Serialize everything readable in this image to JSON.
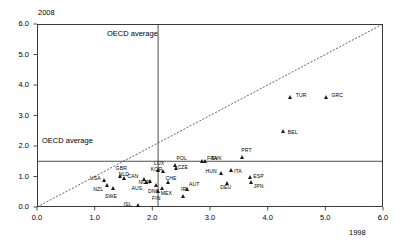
{
  "chart_data": {
    "type": "scatter",
    "title": "",
    "xlabel": "1998",
    "ylabel": "2008",
    "xlim": [
      0.0,
      6.0
    ],
    "ylim": [
      0.0,
      6.0
    ],
    "xticks": [
      "0.0",
      "1.0",
      "2.0",
      "3.0",
      "4.0",
      "5.0",
      "6.0"
    ],
    "yticks": [
      "0.0",
      "1.0",
      "2.0",
      "3.0",
      "4.0",
      "5.0",
      "6.0"
    ],
    "grid": false,
    "legend": "none",
    "annotations": {
      "oecd_average_vertical": "OECD average",
      "oecd_average_horizontal": "OECD average",
      "oecd_average_x": 2.1,
      "oecd_average_y": 1.5,
      "diagonal_reference_line": "y = x"
    },
    "points": [
      {
        "label": "USA",
        "x": 1.18,
        "y": 0.88,
        "lx": -15,
        "ly": -2
      },
      {
        "label": "NZL",
        "x": 1.22,
        "y": 0.72,
        "lx": -14,
        "ly": 4
      },
      {
        "label": "SWE",
        "x": 1.32,
        "y": 0.62,
        "lx": -8,
        "ly": 8
      },
      {
        "label": "GBR",
        "x": 1.45,
        "y": 1.02,
        "lx": -5,
        "ly": -8
      },
      {
        "label": "NLD",
        "x": 1.52,
        "y": 0.95,
        "lx": -6,
        "ly": -4
      },
      {
        "label": "ISL",
        "x": 1.76,
        "y": 0.06,
        "lx": -15,
        "ly": -1
      },
      {
        "label": "CAN",
        "x": 1.86,
        "y": 0.92,
        "lx": -17,
        "ly": -3
      },
      {
        "label": "AUS",
        "x": 1.9,
        "y": 0.8,
        "lx": -15,
        "ly": 5
      },
      {
        "label": "NOR",
        "x": 1.97,
        "y": 0.85,
        "lx": -12,
        "ly": 1
      },
      {
        "label": "DNK",
        "x": 2.08,
        "y": 0.7,
        "lx": -9,
        "ly": 5
      },
      {
        "label": "FIN",
        "x": 2.1,
        "y": 0.52,
        "lx": -6,
        "ly": 7
      },
      {
        "label": "LUX",
        "x": 2.1,
        "y": 1.2,
        "lx": -4,
        "ly": -7
      },
      {
        "label": "MEX",
        "x": 2.18,
        "y": 0.62,
        "lx": -2,
        "ly": 5
      },
      {
        "label": "KOR",
        "x": 2.2,
        "y": 1.18,
        "lx": -13,
        "ly": -2
      },
      {
        "label": "CHE",
        "x": 2.28,
        "y": 0.8,
        "lx": -3,
        "ly": -5
      },
      {
        "label": "POL",
        "x": 2.4,
        "y": 1.38,
        "lx": 1,
        "ly": -7
      },
      {
        "label": "CZE",
        "x": 2.42,
        "y": 1.26,
        "lx": 1,
        "ly": -2
      },
      {
        "label": "IRL",
        "x": 2.55,
        "y": 0.35,
        "lx": -3,
        "ly": -7
      },
      {
        "label": "AUT",
        "x": 2.62,
        "y": 0.58,
        "lx": 1,
        "ly": -5
      },
      {
        "label": "FRA",
        "x": 2.88,
        "y": 1.5,
        "lx": 4,
        "ly": -3
      },
      {
        "label": "SVK",
        "x": 2.92,
        "y": 1.5,
        "lx": 6,
        "ly": -3
      },
      {
        "label": "HUN",
        "x": 3.2,
        "y": 1.12,
        "lx": -16,
        "ly": -2
      },
      {
        "label": "DEU",
        "x": 3.3,
        "y": 0.78,
        "lx": -7,
        "ly": 4
      },
      {
        "label": "ITA",
        "x": 3.38,
        "y": 1.22,
        "lx": 2,
        "ly": 1
      },
      {
        "label": "PRT",
        "x": 3.56,
        "y": 1.62,
        "lx": -1,
        "ly": -8
      },
      {
        "label": "ESP",
        "x": 3.7,
        "y": 0.98,
        "lx": 3,
        "ly": -1
      },
      {
        "label": "JPN",
        "x": 3.72,
        "y": 0.82,
        "lx": 2,
        "ly": 4
      },
      {
        "label": "BEL",
        "x": 4.28,
        "y": 2.48,
        "lx": 4,
        "ly": 1
      },
      {
        "label": "TUR",
        "x": 4.4,
        "y": 3.6,
        "lx": 5,
        "ly": -2
      },
      {
        "label": "GRC",
        "x": 5.02,
        "y": 3.6,
        "lx": 5,
        "ly": -2
      }
    ]
  }
}
